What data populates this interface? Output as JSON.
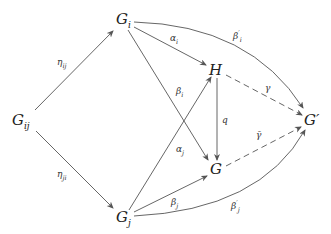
{
  "nodes": {
    "gij": {
      "base": "G",
      "sub": "ij"
    },
    "gi": {
      "base": "G",
      "sub": "i"
    },
    "gj": {
      "base": "G",
      "sub": "j"
    },
    "h": {
      "base": "H"
    },
    "g": {
      "base": "G"
    },
    "gprime": {
      "base": "G",
      "sup": "′"
    }
  },
  "labels": {
    "eta_ij": {
      "base": "η",
      "sub": "ij"
    },
    "eta_ji": {
      "base": "η",
      "sub": "ji"
    },
    "alpha_i": {
      "base": "α",
      "sub": "i"
    },
    "alpha_j": {
      "base": "α",
      "sub": "j"
    },
    "beta_i": {
      "base": "β",
      "sub": "i"
    },
    "beta_j": {
      "base": "β",
      "sub": "j"
    },
    "beta_i_prime": {
      "base": "β",
      "sup": "′",
      "sub": "i"
    },
    "beta_j_prime": {
      "base": "β",
      "sup": "′",
      "sub": "j"
    },
    "q": {
      "base": "q"
    },
    "gamma": {
      "base": "γ"
    },
    "gamma_bar": {
      "base": "γ̄"
    }
  },
  "style": {
    "line_color": "#555555",
    "text_color": "#222222"
  }
}
